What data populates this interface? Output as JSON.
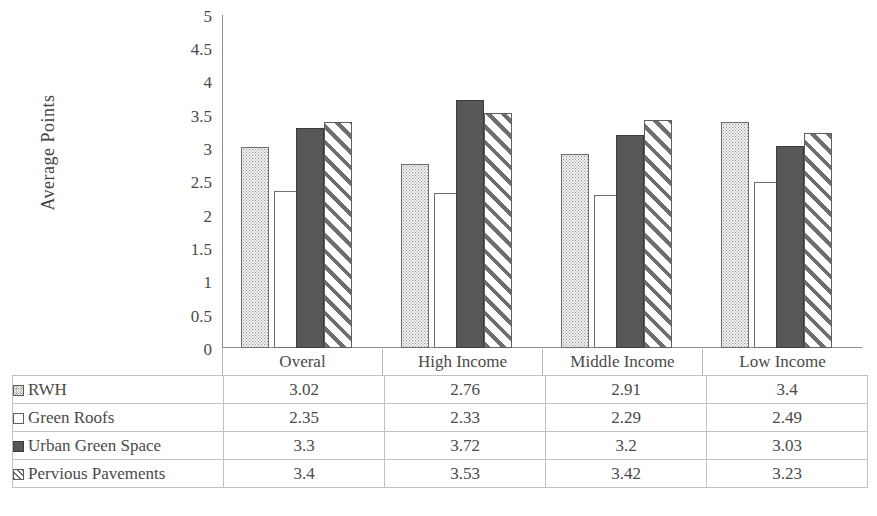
{
  "chart_data": {
    "type": "bar",
    "title": "",
    "xlabel": "",
    "ylabel": "Average Points",
    "ylim": [
      0,
      5
    ],
    "ytick_step": 0.5,
    "yticks": [
      "5",
      "4.5",
      "4",
      "3.5",
      "3",
      "2.5",
      "2",
      "1.5",
      "1",
      "0.5",
      "0"
    ],
    "grid": false,
    "legend_position": "data-table",
    "categories": [
      "Overal",
      "High Income",
      "Middle Income",
      "Low Income"
    ],
    "series": [
      {
        "name": "RWH",
        "marker": "dotted-square",
        "values": [
          3.02,
          2.76,
          2.91,
          3.4
        ]
      },
      {
        "name": "Green Roofs",
        "marker": "empty-square",
        "values": [
          2.35,
          2.33,
          2.29,
          2.49
        ]
      },
      {
        "name": "Urban Green Space",
        "marker": "filled-square",
        "values": [
          3.3,
          3.72,
          3.2,
          3.03
        ]
      },
      {
        "name": "Pervious Pavements",
        "marker": "hatched-square",
        "values": [
          3.4,
          3.53,
          3.42,
          3.23
        ]
      }
    ],
    "value_labels": [
      [
        "3.02",
        "2.76",
        "2.91",
        "3.4"
      ],
      [
        "2.35",
        "2.33",
        "2.29",
        "2.49"
      ],
      [
        "3.3",
        "3.72",
        "3.2",
        "3.03"
      ],
      [
        "3.4",
        "3.53",
        "3.42",
        "3.23"
      ]
    ]
  },
  "colors": {
    "axis": "#8d8d8d",
    "text": "#4a4a4a",
    "table_border": "#c2c2c2",
    "series_solid": "#575757",
    "series_hatch": "#6e6e6e",
    "series_dotted": "#8e8e8e",
    "background": "#ffffff"
  }
}
